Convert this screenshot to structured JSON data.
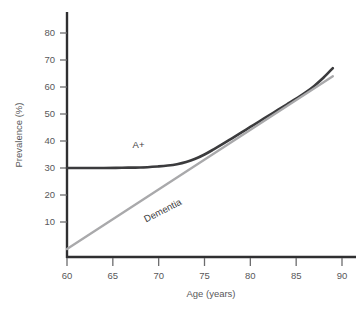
{
  "chart_data": {
    "type": "line",
    "title": "",
    "xlabel": "Age (years)",
    "ylabel": "Prevalence (%)",
    "xlim": [
      59,
      90.5
    ],
    "ylim": [
      0,
      88
    ],
    "xticks": [
      60,
      65,
      70,
      75,
      80,
      85,
      90
    ],
    "yticks": [
      10,
      20,
      30,
      40,
      50,
      60,
      70,
      80
    ],
    "xtick_labels": [
      "60",
      "65",
      "70",
      "75",
      "80",
      "85",
      "90"
    ],
    "ytick_labels": [
      "10",
      "20",
      "30",
      "40",
      "50",
      "60",
      "70",
      "80"
    ],
    "grid": false,
    "legend": "inline-labels",
    "series": [
      {
        "name": "A+",
        "color": "#3b3b3d",
        "label": "A+",
        "label_x": 67.8,
        "label_y": 37.5,
        "label_rotation": 0,
        "x": [
          60,
          62,
          64,
          66,
          68,
          70,
          71,
          72,
          73,
          74,
          75,
          76,
          77,
          78,
          79,
          80,
          81,
          82,
          83,
          84,
          85,
          86,
          87,
          88,
          89
        ],
        "y": [
          30.0,
          30.0,
          30.0,
          30.1,
          30.2,
          30.6,
          30.9,
          31.4,
          32.2,
          33.4,
          35.0,
          36.9,
          38.9,
          41.0,
          43.1,
          45.2,
          47.3,
          49.4,
          51.5,
          53.6,
          55.7,
          57.9,
          60.5,
          63.5,
          67.0
        ]
      },
      {
        "name": "Dementia",
        "color": "#a9a9ab",
        "label": "Dementia",
        "label_x": 70.6,
        "label_y": 13.2,
        "label_rotation": -27,
        "x": [
          60,
          89
        ],
        "y": [
          0,
          64
        ]
      }
    ]
  },
  "axes": {
    "x_axis_label": "Age (years)",
    "y_axis_label": "Prevalence (%)",
    "axis_color": "#2f2f31"
  },
  "figure": {
    "background": "#ffffff"
  }
}
